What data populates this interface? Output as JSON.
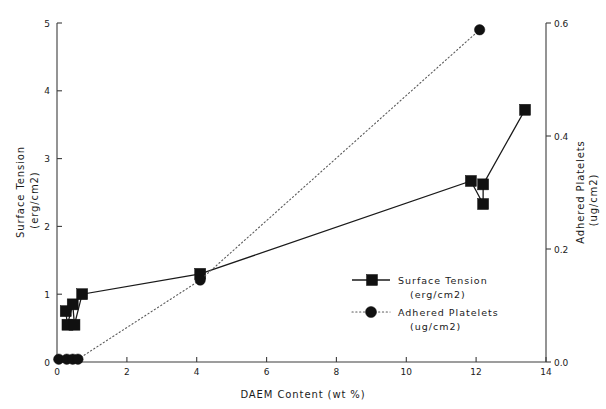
{
  "chart_data": {
    "type": "line",
    "title": "",
    "xlabel": "DAEM Content   (wt %)",
    "ylabel": "Surface Tension\n(erg/cm2)",
    "y2label": "Adhered Platelets\n(ug/cm2)",
    "xlim": [
      0,
      14
    ],
    "ylim": [
      0,
      5
    ],
    "y2lim": [
      0.0,
      0.6
    ],
    "grid": false,
    "legend_position": "center-right",
    "xticks": [
      0,
      2,
      4,
      6,
      8,
      10,
      12,
      14
    ],
    "xtick_labels": [
      "0",
      "2",
      "4",
      "6",
      "8",
      "10",
      "12",
      "14"
    ],
    "yticks": [
      0,
      1,
      2,
      3,
      4,
      5
    ],
    "ytick_labels": [
      "0",
      "1",
      "2",
      "3",
      "4",
      "5"
    ],
    "y2ticks": [
      0.0,
      0.2,
      0.4,
      0.6
    ],
    "y2tick_labels": [
      "0.0",
      "0.2",
      "0.4",
      "0.6"
    ],
    "series": [
      {
        "name": "Surface Tension",
        "units": "(erg/cm2)",
        "axis": "left",
        "marker": "square",
        "linestyle": "solid",
        "color": "#111111",
        "points": [
          {
            "x": 0.25,
            "y": 0.75
          },
          {
            "x": 0.3,
            "y": 0.55
          },
          {
            "x": 0.45,
            "y": 0.85
          },
          {
            "x": 0.5,
            "y": 0.55
          },
          {
            "x": 0.72,
            "y": 1.0
          },
          {
            "x": 4.1,
            "y": 1.3
          },
          {
            "x": 11.85,
            "y": 2.67
          },
          {
            "x": 12.2,
            "y": 2.33
          },
          {
            "x": 12.2,
            "y": 2.62
          },
          {
            "x": 13.4,
            "y": 3.72
          }
        ]
      },
      {
        "name": "Adhered Platelets",
        "units": "(ug/cm2)",
        "axis": "right",
        "marker": "circle",
        "linestyle": "dotted",
        "color": "#111111",
        "points": [
          {
            "x": 0.05,
            "y": 0.005
          },
          {
            "x": 0.28,
            "y": 0.005
          },
          {
            "x": 0.45,
            "y": 0.005
          },
          {
            "x": 0.6,
            "y": 0.005
          },
          {
            "x": 4.1,
            "y": 0.145
          },
          {
            "x": 12.1,
            "y": 0.588
          }
        ]
      }
    ]
  },
  "legend": {
    "entries": [
      {
        "label": "Surface Tension",
        "sublabel": "(erg/cm2)",
        "marker": "square",
        "line": "solid"
      },
      {
        "label": "Adhered Platelets",
        "sublabel": "(ug/cm2)",
        "marker": "circle",
        "line": "dotted"
      }
    ]
  },
  "axes": {
    "x_title": "DAEM Content   (wt %)",
    "y_title_line1": "Surface Tension",
    "y_title_line2": "(erg/cm2)",
    "y2_title_line1": "Adhered Platelets",
    "y2_title_line2": "(ug/cm2)"
  }
}
